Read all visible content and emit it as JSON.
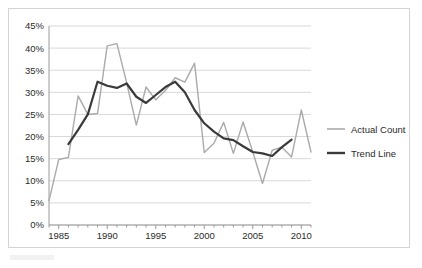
{
  "chart_data": {
    "type": "line",
    "title": "",
    "xlabel": "",
    "ylabel": "",
    "xlim": [
      1984,
      2011
    ],
    "ylim": [
      0,
      45
    ],
    "grid": "horizontal",
    "legend_position": "right",
    "y_ticks": [
      "0%",
      "5%",
      "10%",
      "15%",
      "20%",
      "25%",
      "30%",
      "35%",
      "40%",
      "45%"
    ],
    "y_tick_values": [
      0,
      5,
      10,
      15,
      20,
      25,
      30,
      35,
      40,
      45
    ],
    "x_ticks": [
      "1985",
      "1990",
      "1995",
      "2000",
      "2005",
      "2010"
    ],
    "x_tick_values": [
      1985,
      1990,
      1995,
      2000,
      2005,
      2010
    ],
    "x_minor_tick_values": [
      1984,
      1985,
      1986,
      1987,
      1988,
      1989,
      1990,
      1991,
      1992,
      1993,
      1994,
      1995,
      1996,
      1997,
      1998,
      1999,
      2000,
      2001,
      2002,
      2003,
      2004,
      2005,
      2006,
      2007,
      2008,
      2009,
      2010,
      2011
    ],
    "series": [
      {
        "name": "Actual Count",
        "color": "#aaaaaa",
        "width": 1.4,
        "x": [
          1984,
          1985,
          1986,
          1987,
          1988,
          1989,
          1990,
          1991,
          1992,
          1993,
          1994,
          1995,
          1996,
          1997,
          1998,
          1999,
          2000,
          2001,
          2002,
          2003,
          2004,
          2005,
          2006,
          2007,
          2008,
          2009,
          2010,
          2011
        ],
        "values": [
          5.5,
          14.8,
          15.3,
          29.2,
          25.0,
          25.2,
          40.5,
          41.0,
          32.2,
          22.6,
          31.2,
          28.3,
          30.4,
          33.3,
          32.3,
          36.6,
          16.4,
          18.5,
          23.2,
          16.2,
          23.3,
          16.5,
          9.4,
          16.9,
          17.6,
          15.4,
          26.0,
          16.5
        ]
      },
      {
        "name": "Trend Line",
        "color": "#3a3a3a",
        "width": 2.2,
        "x": [
          1986,
          1987,
          1988,
          1989,
          1990,
          1991,
          1992,
          1993,
          1994,
          1995,
          1996,
          1997,
          1998,
          1999,
          2000,
          2001,
          2002,
          2003,
          2004,
          2005,
          2006,
          2007,
          2008,
          2009
        ],
        "values": [
          18.3,
          21.5,
          25.0,
          32.4,
          31.5,
          31.0,
          32.0,
          29.0,
          27.6,
          29.4,
          31.2,
          32.4,
          30.0,
          26.0,
          23.0,
          21.1,
          19.6,
          19.2,
          17.8,
          16.5,
          16.2,
          15.6,
          17.6,
          19.3
        ]
      }
    ]
  },
  "legend": {
    "items": [
      {
        "label": "Actual Count",
        "color": "#aaaaaa",
        "width": 1.6
      },
      {
        "label": "Trend Line",
        "color": "#3a3a3a",
        "width": 2.4
      }
    ]
  },
  "style": {
    "frame_border": "#d4d4d4",
    "gridline_color": "#d9d9d9",
    "axis_color": "#9a9a9a",
    "text_color": "#2b2b2b",
    "background": "#ffffff"
  }
}
